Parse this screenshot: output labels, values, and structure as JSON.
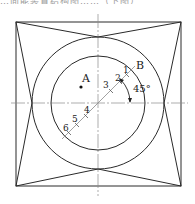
{
  "caption": "…面能装置结构图……（下图）",
  "diagram": {
    "points": {
      "A": {
        "label": "A"
      },
      "B": {
        "label": "B"
      }
    },
    "marks": [
      "1",
      "2",
      "3",
      "4",
      "5",
      "6"
    ],
    "angle_label": "45°",
    "colors": {
      "stroke": "#2a2a2a",
      "centerline": "#8a8a8a",
      "background": "#ffffff"
    }
  }
}
